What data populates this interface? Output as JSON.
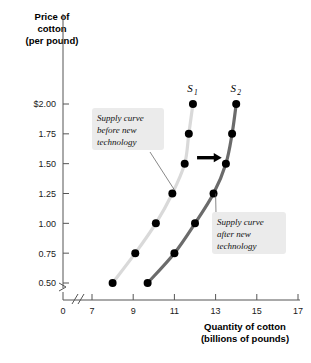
{
  "chart_data": {
    "type": "line",
    "title": "",
    "xlabel": "Quantity of cotton (billions of pounds)",
    "ylabel": "Price of cotton (per pound)",
    "xlim": [
      7,
      17
    ],
    "ylim": [
      0.5,
      2.0
    ],
    "grid": false,
    "legend_position": "inline-labels",
    "x_axis_break": true,
    "y_axis_break": true,
    "x_origin_label": "0",
    "xticks": [
      7,
      9,
      11,
      13,
      15,
      17
    ],
    "xtick_labels": [
      "7",
      "9",
      "11",
      "13",
      "15",
      "17"
    ],
    "yticks": [
      0.5,
      0.75,
      1.0,
      1.25,
      1.5,
      1.75,
      2.0
    ],
    "ytick_labels": [
      "0.50",
      "0.75",
      "1.00",
      "1.25",
      "1.50",
      "1.75",
      "$2.00"
    ],
    "series": [
      {
        "name": "S1",
        "label": "S",
        "subscript": "1",
        "color": "#d9d9d9",
        "marker_color": "#000000",
        "points": [
          {
            "x": 8.0,
            "y": 0.5
          },
          {
            "x": 9.1,
            "y": 0.75
          },
          {
            "x": 10.1,
            "y": 1.0
          },
          {
            "x": 10.9,
            "y": 1.25
          },
          {
            "x": 11.5,
            "y": 1.5
          },
          {
            "x": 11.7,
            "y": 1.75
          },
          {
            "x": 11.9,
            "y": 2.0
          }
        ]
      },
      {
        "name": "S2",
        "label": "S",
        "subscript": "2",
        "color": "#6b6b6b",
        "marker_color": "#000000",
        "points": [
          {
            "x": 9.7,
            "y": 0.5
          },
          {
            "x": 11.0,
            "y": 0.75
          },
          {
            "x": 12.0,
            "y": 1.0
          },
          {
            "x": 12.9,
            "y": 1.25
          },
          {
            "x": 13.5,
            "y": 1.5
          },
          {
            "x": 13.8,
            "y": 1.75
          },
          {
            "x": 14.0,
            "y": 2.0
          }
        ]
      }
    ],
    "annotations": [
      {
        "id": "before",
        "lines": [
          "Supply curve",
          "before new",
          "technology"
        ],
        "target_x": 11.0,
        "target_y": 1.28
      },
      {
        "id": "after",
        "lines": [
          "Supply curve",
          "after new",
          "technology"
        ],
        "target_x": 13.0,
        "target_y": 1.25
      }
    ],
    "shift_arrow": {
      "label": "shift-right-arrow",
      "color": "#000000",
      "y": 1.55,
      "x_start": 12.1,
      "x_end": 13.3
    }
  },
  "axis": {
    "y_title_lines": [
      "Price of",
      "cotton",
      "(per pound)"
    ],
    "x_title_lines": [
      "Quantity of cotton",
      "(billions of pounds)"
    ]
  }
}
